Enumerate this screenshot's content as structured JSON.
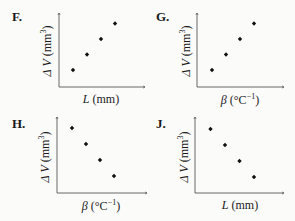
{
  "chart_data": [
    {
      "panel": "F.",
      "type": "scatter",
      "xlabel": "L (mm)",
      "xlabel_var": "L",
      "xlabel_unit": " (mm)",
      "ylabel": "ΔV (mm3)",
      "ylabel_var": "Δ V",
      "ylabel_unit": " (mm",
      "ylabel_exp": "3",
      "ylabel_close": ")",
      "trend": "increasing",
      "points": [
        [
          1,
          1
        ],
        [
          2,
          2
        ],
        [
          3,
          3
        ],
        [
          4,
          4
        ]
      ],
      "grid": false,
      "ticks": false
    },
    {
      "panel": "G.",
      "type": "scatter",
      "xlabel": "β (°C−1)",
      "xlabel_var": "β",
      "xlabel_unit": " (°C",
      "xlabel_exp": "−1",
      "xlabel_close": ")",
      "ylabel": "ΔV (mm3)",
      "ylabel_var": "Δ V",
      "ylabel_unit": " (mm",
      "ylabel_exp": "3",
      "ylabel_close": ")",
      "trend": "increasing",
      "points": [
        [
          1,
          1
        ],
        [
          2,
          2
        ],
        [
          3,
          3
        ],
        [
          4,
          4
        ]
      ],
      "grid": false,
      "ticks": false
    },
    {
      "panel": "H.",
      "type": "scatter",
      "xlabel": "β (°C−1)",
      "xlabel_var": "β",
      "xlabel_unit": " (°C",
      "xlabel_exp": "−1",
      "xlabel_close": ")",
      "ylabel": "ΔV (mm3)",
      "ylabel_var": "Δ V",
      "ylabel_unit": " (mm",
      "ylabel_exp": "3",
      "ylabel_close": ")",
      "trend": "decreasing",
      "points": [
        [
          1,
          4
        ],
        [
          2,
          3
        ],
        [
          3,
          2
        ],
        [
          4,
          1
        ]
      ],
      "grid": false,
      "ticks": false
    },
    {
      "panel": "J.",
      "type": "scatter",
      "xlabel": "L (mm)",
      "xlabel_var": "L",
      "xlabel_unit": " (mm)",
      "ylabel": "ΔV (mm3)",
      "ylabel_var": "Δ V",
      "ylabel_unit": " (mm",
      "ylabel_exp": "3",
      "ylabel_close": ")",
      "trend": "decreasing",
      "points": [
        [
          1,
          4
        ],
        [
          2,
          3
        ],
        [
          3,
          2
        ],
        [
          4,
          1
        ]
      ],
      "grid": false,
      "ticks": false
    }
  ]
}
